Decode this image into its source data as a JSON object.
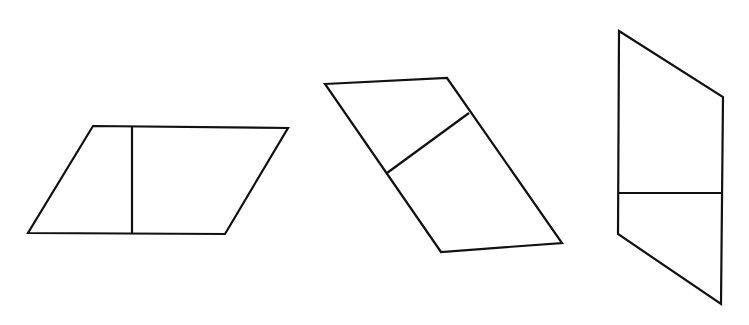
{
  "figure": {
    "background": "#ffffff",
    "stroke_color": "#111111",
    "shapes": [
      {
        "name": "parallelogram-1",
        "kind": "parallelogram",
        "points": [
          [
            93,
            126
          ],
          [
            288,
            128
          ],
          [
            225,
            234
          ],
          [
            28,
            233
          ]
        ],
        "divider": {
          "orientation": "vertical",
          "from": [
            132,
            126
          ],
          "to": [
            132,
            234
          ]
        }
      },
      {
        "name": "parallelogram-2",
        "kind": "parallelogram",
        "points": [
          [
            325,
            84
          ],
          [
            447,
            78
          ],
          [
            562,
            243
          ],
          [
            441,
            252
          ]
        ],
        "divider": {
          "orientation": "diagonal",
          "from": [
            387,
            173
          ],
          "to": [
            469,
            113
          ]
        }
      },
      {
        "name": "parallelogram-3",
        "kind": "parallelogram",
        "points": [
          [
            619,
            31
          ],
          [
            723,
            97
          ],
          [
            721,
            304
          ],
          [
            618,
            234
          ]
        ],
        "divider": {
          "orientation": "horizontal",
          "from": [
            618,
            193
          ],
          "to": [
            722,
            193
          ]
        }
      }
    ]
  }
}
